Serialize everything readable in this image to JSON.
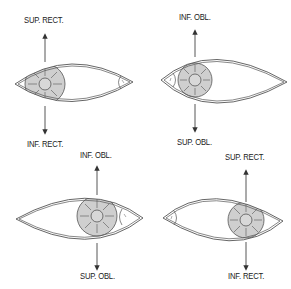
{
  "colors": {
    "line": "#555555",
    "iris_fill": "#cfcfcf",
    "background": "#ffffff",
    "text": "#222222"
  },
  "panels": [
    {
      "position": "top-left",
      "eye_orientation": "iris-left, caruncle-right",
      "top_label": "SUP. RECT.",
      "bottom_label": "INF. RECT."
    },
    {
      "position": "top-right",
      "eye_orientation": "caruncle-left, iris-left",
      "top_label": "INF. OBL.",
      "bottom_label": "SUP. OBL."
    },
    {
      "position": "bottom-left",
      "eye_orientation": "iris-right, caruncle-right",
      "top_label": "INF. OBL.",
      "bottom_label": "SUP. OBL."
    },
    {
      "position": "bottom-right",
      "eye_orientation": "caruncle-left, iris-right",
      "top_label": "SUP. RECT.",
      "bottom_label": "INF. RECT."
    }
  ]
}
